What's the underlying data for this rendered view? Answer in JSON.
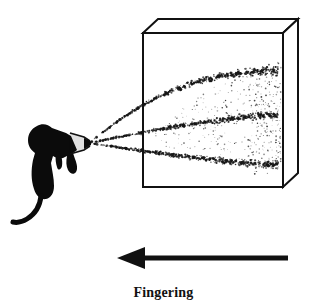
{
  "figure": {
    "title": "Fingering",
    "caption": "Fingering",
    "background_color": "#ffffff",
    "ink_color": "#111111",
    "description_items": [
      "spray-gun",
      "spray-fan",
      "box",
      "direction-arrow",
      "caption"
    ]
  },
  "caption": {
    "label": "Fingering"
  },
  "spray_gun": {
    "name": "spray-gun",
    "fill_color": "#0b0b0b",
    "nozzle_x": 90,
    "nozzle_y": 143,
    "body_x": 30,
    "body_y": 150,
    "hose_end_x": 12,
    "hose_end_y": 222
  },
  "box": {
    "name": "spray-booth-box",
    "stroke_color": "#111111",
    "stroke_width": 2,
    "front_left_x": 143,
    "front_right_x": 283,
    "front_top_y": 33,
    "front_bottom_y": 187,
    "depth_dx": 15,
    "depth_dy": -14
  },
  "spray": {
    "name": "spray-fan",
    "dot_color": "#151515",
    "streams": [
      {
        "name": "upper-band",
        "label": "upper finger",
        "origin": [
          90,
          143
        ],
        "end": [
          278,
          71
        ]
      },
      {
        "name": "middle-band",
        "label": "middle finger",
        "origin": [
          90,
          143
        ],
        "end": [
          278,
          115
        ]
      },
      {
        "name": "lower-band",
        "label": "lower finger",
        "origin": [
          90,
          143
        ],
        "end": [
          278,
          165
        ]
      }
    ],
    "mist_density": "medium",
    "mist_dot_count": 260
  },
  "arrow": {
    "name": "direction-arrow",
    "direction": "left",
    "color": "#111111",
    "tip_x": 117,
    "tail_x": 288,
    "y": 258,
    "shaft_thickness": 5,
    "head_length": 26,
    "head_half_height": 11
  }
}
